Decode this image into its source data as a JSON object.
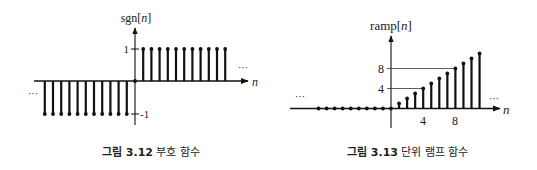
{
  "figures": [
    {
      "caption_prefix": "그림 3.12",
      "caption_text": "부호 함수",
      "ylabel": "sgn[n]",
      "ylabel_base": "sgn[",
      "ylabel_var": "n",
      "ylabel_end": "]",
      "xlabel": "n",
      "ytick_labels": [
        "1",
        "-1"
      ],
      "ellipsis": "···"
    },
    {
      "caption_prefix": "그림 3.13",
      "caption_text": "단위 램프 함수",
      "ylabel": "ramp[n]",
      "ylabel_base": "ramp[",
      "ylabel_var": "n",
      "ylabel_end": "]",
      "xlabel": "n",
      "ytick_labels": [
        "8",
        "4"
      ],
      "xtick_labels": [
        "4",
        "8"
      ],
      "ellipsis": "···"
    }
  ],
  "chart_data": [
    {
      "type": "stem",
      "title": "그림 3.12 부호 함수",
      "xlabel": "n",
      "ylabel": "sgn[n]",
      "x": [
        -11,
        -10,
        -9,
        -8,
        -7,
        -6,
        -5,
        -4,
        -3,
        -2,
        -1,
        0,
        1,
        2,
        3,
        4,
        5,
        6,
        7,
        8,
        9,
        10,
        11
      ],
      "values": [
        -1,
        -1,
        -1,
        -1,
        -1,
        -1,
        -1,
        -1,
        -1,
        -1,
        -1,
        0,
        1,
        1,
        1,
        1,
        1,
        1,
        1,
        1,
        1,
        1,
        1
      ],
      "yticks": [
        1,
        -1
      ],
      "ylim": [
        -1,
        1
      ],
      "continues_both_sides": true
    },
    {
      "type": "stem",
      "title": "그림 3.13 단위 램프 함수",
      "xlabel": "n",
      "ylabel": "ramp[n]",
      "x": [
        -9,
        -8,
        -7,
        -6,
        -5,
        -4,
        -3,
        -2,
        -1,
        0,
        1,
        2,
        3,
        4,
        5,
        6,
        7,
        8,
        9,
        10,
        11
      ],
      "values": [
        0,
        0,
        0,
        0,
        0,
        0,
        0,
        0,
        0,
        0,
        1,
        2,
        3,
        4,
        5,
        6,
        7,
        8,
        9,
        10,
        11
      ],
      "xticks": [
        4,
        8
      ],
      "yticks": [
        4,
        8
      ],
      "reference_lines": [
        {
          "y": 4,
          "to_x": 4
        },
        {
          "y": 8,
          "to_x": 8
        }
      ],
      "ylim": [
        0,
        11
      ],
      "continues_both_sides": true
    }
  ]
}
